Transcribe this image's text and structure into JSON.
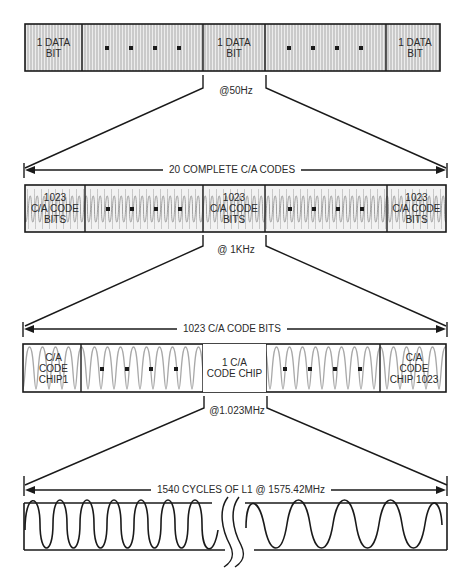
{
  "diagram": {
    "level1": {
      "cells": [
        {
          "label": "1 DATA\nBIT"
        },
        {
          "label": "",
          "dots": 4
        },
        {
          "label": "1 DATA\nBIT"
        },
        {
          "label": "",
          "dots": 4
        },
        {
          "label": "1 DATA\nBIT"
        }
      ],
      "rate_label": "@50Hz"
    },
    "level2": {
      "span_label": "20 COMPLETE C/A CODES",
      "cells": [
        {
          "label": "1023\nC/A CODE\nBITS"
        },
        {
          "label": "",
          "dots": 4
        },
        {
          "label": "1023\nC/A CODE\nBITS"
        },
        {
          "label": "",
          "dots": 4
        },
        {
          "label": "1023\nC/A CODE\nBITS"
        }
      ],
      "rate_label": "@ 1KHz"
    },
    "level3": {
      "span_label": "1023 C/A CODE BITS",
      "cells": [
        {
          "label": "C/A\nCODE\nCHIP1"
        },
        {
          "label": "",
          "dots": 4
        },
        {
          "label": "1 C/A\nCODE CHIP"
        },
        {
          "label": "",
          "dots": 4
        },
        {
          "label": "C/A\nCODE\nCHIP 1023"
        }
      ],
      "rate_label": "@1.023MHz"
    },
    "level4": {
      "span_label": "1540 CYCLES OF L1 @ 1575.42MHz",
      "cycles_left": 7,
      "cycles_right": 7
    },
    "colors": {
      "line": "#1a1a1a",
      "fill_pattern": "#b8b8b8",
      "cell_bg": "#e6e6e6",
      "text": "#2a2a2a"
    }
  }
}
